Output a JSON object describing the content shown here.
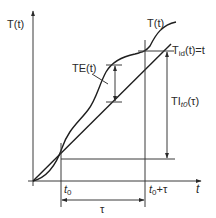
{
  "diagram": {
    "y_axis_label": "T(t)",
    "x_axis_label": "t",
    "curve_label": "T(t)",
    "ideal_line_label": "T",
    "ideal_line_sub": "id",
    "ideal_line_suffix": "(t)=t",
    "error_label": "TE(t)",
    "interval_label": "TI",
    "interval_sub": "t0",
    "interval_suffix": "(τ)",
    "t0_label": "t",
    "t0_sub": "0",
    "t0_tau_label": "t",
    "t0_tau_sub": "0",
    "t0_tau_suffix": "+τ",
    "tau_label": "τ",
    "colors": {
      "line": "#3a3a3a",
      "curve": "#1e1e1e",
      "text": "#2a2a2a",
      "background": "#ffffff"
    }
  }
}
